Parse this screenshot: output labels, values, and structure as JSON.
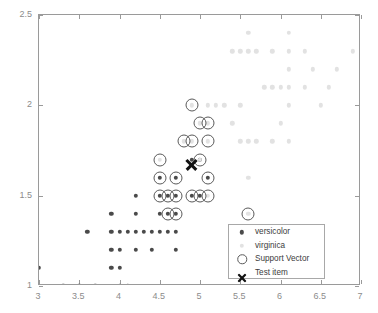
{
  "chart_data": {
    "type": "scatter",
    "title": "",
    "xlabel": "",
    "ylabel": "",
    "xlim": [
      3,
      7
    ],
    "ylim": [
      1,
      2.5
    ],
    "xticks": [
      3,
      3.5,
      4,
      4.5,
      5,
      5.5,
      6,
      6.5,
      7
    ],
    "xticklabels": [
      "3",
      "3.5",
      "4",
      "4.5",
      "5",
      "5.5",
      "6",
      "6.5",
      "7"
    ],
    "yticks": [
      1,
      1.5,
      2,
      2.5
    ],
    "yticklabels": [
      "1",
      "1.5",
      "2",
      "2.5"
    ],
    "grid": false,
    "legend_position": "lower right",
    "colors": {
      "versicolor": "#4a4a4a",
      "virginica": "#e2e2e2",
      "support_vector": "#5a5a5a",
      "test_item": "#111111",
      "axis": "#9a9a9a",
      "tick_label": "#8c8c8c"
    },
    "series": [
      {
        "name": "versicolor",
        "marker": "filled-circle",
        "points": [
          [
            3.0,
            1.1
          ],
          [
            3.3,
            1.0
          ],
          [
            3.5,
            1.0
          ],
          [
            3.7,
            1.0
          ],
          [
            4.0,
            1.0
          ],
          [
            4.1,
            1.0
          ],
          [
            3.9,
            1.1
          ],
          [
            4.0,
            1.1
          ],
          [
            3.9,
            1.2
          ],
          [
            4.0,
            1.2
          ],
          [
            4.2,
            1.2
          ],
          [
            4.4,
            1.2
          ],
          [
            4.7,
            1.2
          ],
          [
            3.6,
            1.3
          ],
          [
            3.9,
            1.3
          ],
          [
            4.0,
            1.3
          ],
          [
            4.1,
            1.3
          ],
          [
            4.2,
            1.3
          ],
          [
            4.3,
            1.3
          ],
          [
            4.4,
            1.3
          ],
          [
            4.5,
            1.3
          ],
          [
            4.6,
            1.3
          ],
          [
            4.7,
            1.3
          ],
          [
            3.9,
            1.4
          ],
          [
            4.2,
            1.4
          ],
          [
            4.5,
            1.4
          ],
          [
            4.6,
            1.4
          ],
          [
            4.7,
            1.4
          ],
          [
            4.2,
            1.5
          ],
          [
            4.5,
            1.5
          ],
          [
            4.6,
            1.5
          ],
          [
            4.7,
            1.5
          ],
          [
            4.9,
            1.5
          ],
          [
            5.0,
            1.5
          ],
          [
            4.5,
            1.6
          ],
          [
            4.7,
            1.6
          ],
          [
            5.1,
            1.6
          ],
          [
            4.9,
            1.7
          ],
          [
            5.0,
            1.7
          ]
        ]
      },
      {
        "name": "virginica",
        "marker": "filled-circle-light",
        "points": [
          [
            5.6,
            2.4
          ],
          [
            6.1,
            2.4
          ],
          [
            5.4,
            2.3
          ],
          [
            5.5,
            2.3
          ],
          [
            5.6,
            2.3
          ],
          [
            5.7,
            2.3
          ],
          [
            5.9,
            2.3
          ],
          [
            6.1,
            2.3
          ],
          [
            6.3,
            2.3
          ],
          [
            6.9,
            2.3
          ],
          [
            6.1,
            2.2
          ],
          [
            6.4,
            2.2
          ],
          [
            6.7,
            2.2
          ],
          [
            5.8,
            2.1
          ],
          [
            5.9,
            2.1
          ],
          [
            6.0,
            2.1
          ],
          [
            6.1,
            2.1
          ],
          [
            6.3,
            2.1
          ],
          [
            6.6,
            2.1
          ],
          [
            4.9,
            2.0
          ],
          [
            5.1,
            2.0
          ],
          [
            5.2,
            2.0
          ],
          [
            5.3,
            2.0
          ],
          [
            5.5,
            2.0
          ],
          [
            6.1,
            2.0
          ],
          [
            6.5,
            2.0
          ],
          [
            5.0,
            1.9
          ],
          [
            5.1,
            1.9
          ],
          [
            5.4,
            1.9
          ],
          [
            6.0,
            1.9
          ],
          [
            4.8,
            1.8
          ],
          [
            4.9,
            1.8
          ],
          [
            5.1,
            1.8
          ],
          [
            5.5,
            1.8
          ],
          [
            5.6,
            1.8
          ],
          [
            5.7,
            1.8
          ],
          [
            5.9,
            1.8
          ],
          [
            6.1,
            1.8
          ],
          [
            4.5,
            1.7
          ],
          [
            5.0,
            1.7
          ],
          [
            5.6,
            1.6
          ],
          [
            5.1,
            1.5
          ],
          [
            5.6,
            1.4
          ]
        ]
      }
    ],
    "support_vectors": [
      [
        4.9,
        2.0
      ],
      [
        5.0,
        1.9
      ],
      [
        5.1,
        1.9
      ],
      [
        4.8,
        1.8
      ],
      [
        4.9,
        1.8
      ],
      [
        5.1,
        1.8
      ],
      [
        4.5,
        1.7
      ],
      [
        5.0,
        1.7
      ],
      [
        4.5,
        1.6
      ],
      [
        4.7,
        1.6
      ],
      [
        5.1,
        1.6
      ],
      [
        4.5,
        1.5
      ],
      [
        4.6,
        1.5
      ],
      [
        4.7,
        1.5
      ],
      [
        4.9,
        1.5
      ],
      [
        5.0,
        1.5
      ],
      [
        5.1,
        1.5
      ],
      [
        4.6,
        1.4
      ],
      [
        4.7,
        1.4
      ],
      [
        5.6,
        1.4
      ]
    ],
    "test_items": [
      [
        4.9,
        1.67
      ]
    ]
  },
  "legend": {
    "entries": [
      {
        "label": "versicolor",
        "symbol": "filled-dot-dark"
      },
      {
        "label": "virginica",
        "symbol": "filled-dot-light"
      },
      {
        "label": "Support Vector",
        "symbol": "open-circle"
      },
      {
        "label": "Test item",
        "symbol": "x-cross"
      }
    ]
  }
}
